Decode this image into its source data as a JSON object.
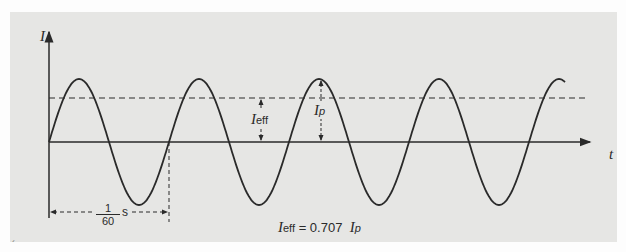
{
  "figure": {
    "y_axis_label": "I",
    "x_axis_label": "t",
    "rms_label": {
      "main": "I",
      "sub": "eff"
    },
    "peak_label": {
      "main": "I",
      "sub": "p"
    },
    "period_label": {
      "numerator": "1",
      "denominator": "60",
      "unit": "s"
    },
    "equation": {
      "lhs_main": "I",
      "lhs_sub": "eff",
      "eq": "= 0.707",
      "rhs_main": "I",
      "rhs_sub": "p"
    },
    "corner_mark": "´"
  },
  "colors": {
    "panel": "#e6e6e4",
    "ink": "#2a2a2a",
    "page": "#fdfdfd"
  },
  "geometry": {
    "rms_fraction": 0.707,
    "cycles_shown": 4.3,
    "period_seconds": "1/60"
  }
}
